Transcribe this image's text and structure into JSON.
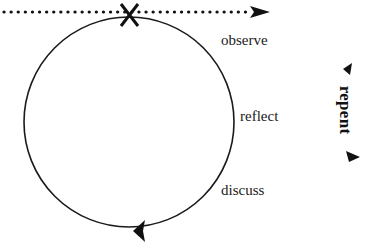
{
  "diagram": {
    "type": "cycle",
    "cycle_labels": [
      {
        "id": "observe",
        "text": "observe"
      },
      {
        "id": "reflect",
        "text": "reflect"
      },
      {
        "id": "discuss",
        "text": "discuss"
      }
    ],
    "side_label": {
      "text": "repent"
    },
    "markers": {
      "entry_point": "X",
      "timeline": "dotted-arrow"
    },
    "colors": {
      "stroke": "#1a1a1a",
      "background": "#ffffff"
    }
  }
}
